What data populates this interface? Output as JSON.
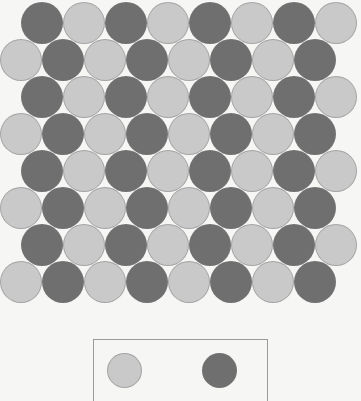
{
  "figure": {
    "title": "",
    "background_color": "#f6f6f4"
  },
  "colors": {
    "light": "#c9c9c9",
    "dark": "#6f6f6f",
    "legend_border": "#9a9a9a",
    "circle_outline": "#787878"
  },
  "chart_data": {
    "type": "scatter",
    "title": "",
    "subtitle": "",
    "xlabel": "",
    "ylabel": "",
    "grid": false,
    "legend_position": "bottom-center",
    "marker": "circle",
    "marker_diameter_px": 42,
    "row_count": 8,
    "columns_per_row": 8,
    "row_vertical_spacing_px": 37,
    "row_offset_px": 21,
    "categories": [
      "light",
      "dark"
    ],
    "legend": [
      {
        "key": "light",
        "label": "",
        "color": "#c9c9c9"
      },
      {
        "key": "dark",
        "label": "",
        "color": "#6f6f6f"
      }
    ],
    "counts": {
      "light": 32,
      "dark": 32,
      "total": 64
    },
    "rows": [
      {
        "index": 0,
        "offset_px": 21,
        "top_px": 2,
        "cells": [
          "dark",
          "light",
          "dark",
          "light",
          "dark",
          "light",
          "dark",
          "light"
        ]
      },
      {
        "index": 1,
        "offset_px": 0,
        "top_px": 39,
        "cells": [
          "light",
          "dark",
          "light",
          "dark",
          "light",
          "dark",
          "light",
          "dark"
        ]
      },
      {
        "index": 2,
        "offset_px": 21,
        "top_px": 76,
        "cells": [
          "dark",
          "light",
          "dark",
          "light",
          "dark",
          "light",
          "dark",
          "light"
        ]
      },
      {
        "index": 3,
        "offset_px": 0,
        "top_px": 113,
        "cells": [
          "light",
          "dark",
          "light",
          "dark",
          "light",
          "dark",
          "light",
          "dark"
        ]
      },
      {
        "index": 4,
        "offset_px": 21,
        "top_px": 150,
        "cells": [
          "dark",
          "light",
          "dark",
          "light",
          "dark",
          "light",
          "dark",
          "light"
        ]
      },
      {
        "index": 5,
        "offset_px": 0,
        "top_px": 187,
        "cells": [
          "light",
          "dark",
          "light",
          "dark",
          "light",
          "dark",
          "light",
          "dark"
        ]
      },
      {
        "index": 6,
        "offset_px": 21,
        "top_px": 224,
        "cells": [
          "dark",
          "light",
          "dark",
          "light",
          "dark",
          "light",
          "dark",
          "light"
        ]
      },
      {
        "index": 7,
        "offset_px": 0,
        "top_px": 261,
        "cells": [
          "light",
          "dark",
          "light",
          "dark",
          "light",
          "dark",
          "light",
          "dark"
        ]
      }
    ]
  }
}
